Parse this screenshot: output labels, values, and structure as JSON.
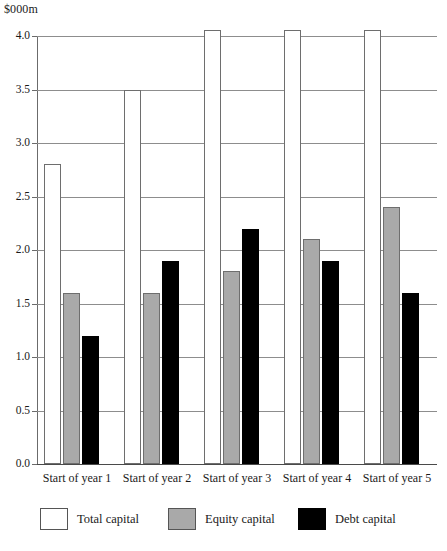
{
  "chart_data": {
    "type": "bar",
    "title": "",
    "subtitle": "",
    "unit_label": "$000m",
    "xlabel": "",
    "ylabel": "",
    "ylim": [
      0.0,
      4.0
    ],
    "ytick_values": [
      0.0,
      0.5,
      1.0,
      1.5,
      2.0,
      2.5,
      3.0,
      3.5,
      4.0
    ],
    "ytick_labels": [
      "0.0",
      "0.5",
      "1.0",
      "1.5",
      "2.0",
      "2.5",
      "3.0",
      "3.5",
      "4.0"
    ],
    "grid": true,
    "grid_axis": "y",
    "legend_position": "bottom",
    "categories": [
      "Start of year 1",
      "Start of year 2",
      "Start of year 3",
      "Start of year 4",
      "Start of year 5"
    ],
    "series": [
      {
        "name": "Total capital",
        "color": "#ffffff",
        "values": [
          2.8,
          3.5,
          4.0,
          4.0,
          4.0
        ]
      },
      {
        "name": "Equity capital",
        "color": "#a9a9a9",
        "values": [
          1.6,
          1.6,
          1.8,
          2.1,
          2.4
        ]
      },
      {
        "name": "Debt capital",
        "color": "#000000",
        "values": [
          1.2,
          1.9,
          2.2,
          1.9,
          1.6
        ]
      }
    ]
  },
  "legend": {
    "items": [
      {
        "label": "Total capital",
        "swatch": "total"
      },
      {
        "label": "Equity capital",
        "swatch": "equity"
      },
      {
        "label": "Debt capital",
        "swatch": "debt"
      }
    ]
  }
}
